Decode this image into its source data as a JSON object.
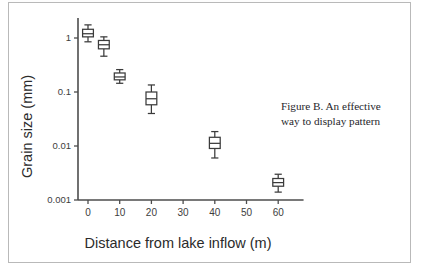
{
  "figure": {
    "caption_line1": "Figure B. An effective",
    "caption_line2": "way to display pattern"
  },
  "chart_data": {
    "type": "box",
    "title": "",
    "xlabel": "Distance from lake inflow (m)",
    "ylabel": "Grain size (mm)",
    "xlim": [
      -3,
      68
    ],
    "ylim": [
      0.001,
      2.0
    ],
    "yscale": "log",
    "grid": false,
    "legend": null,
    "x_ticks": [
      "0",
      "10",
      "20",
      "30",
      "40",
      "50",
      "60"
    ],
    "x_tick_values": [
      0,
      10,
      20,
      30,
      40,
      50,
      60
    ],
    "y_ticks": [
      "1",
      "0.1",
      "0.01",
      "0.001"
    ],
    "y_tick_values": [
      1,
      0.1,
      0.01,
      0.001
    ],
    "x": [
      0,
      5,
      10,
      20,
      40,
      60
    ],
    "boxes": [
      {
        "x": 0,
        "whisker_low": 0.85,
        "q1": 1.05,
        "median": 1.2,
        "q3": 1.45,
        "whisker_high": 1.75
      },
      {
        "x": 5,
        "whisker_low": 0.46,
        "q1": 0.63,
        "median": 0.75,
        "q3": 0.9,
        "whisker_high": 1.05
      },
      {
        "x": 10,
        "whisker_low": 0.145,
        "q1": 0.168,
        "median": 0.19,
        "q3": 0.225,
        "whisker_high": 0.26
      },
      {
        "x": 20,
        "whisker_low": 0.04,
        "q1": 0.058,
        "median": 0.075,
        "q3": 0.1,
        "whisker_high": 0.135
      },
      {
        "x": 40,
        "whisker_low": 0.006,
        "q1": 0.009,
        "median": 0.0112,
        "q3": 0.0145,
        "whisker_high": 0.0185
      },
      {
        "x": 60,
        "whisker_low": 0.0014,
        "q1": 0.0018,
        "median": 0.0021,
        "q3": 0.0025,
        "whisker_high": 0.003
      }
    ]
  }
}
